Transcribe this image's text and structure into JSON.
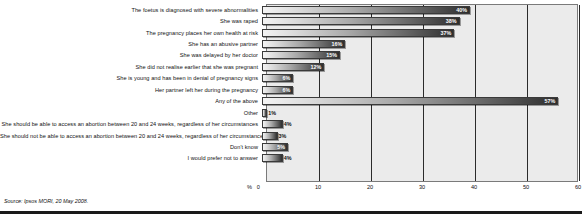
{
  "chart_data": {
    "type": "bar",
    "orientation": "horizontal",
    "title": "",
    "subtitle": "",
    "xlabel": "%",
    "ylabel": "",
    "xlim": [
      0,
      60
    ],
    "grid": true,
    "legend": false,
    "unit_label": "%",
    "axis_zero_label": "0",
    "tick_labels": [
      "10",
      "20",
      "30",
      "40",
      "50",
      "60"
    ],
    "tick_values": [
      10,
      20,
      30,
      40,
      50,
      60
    ],
    "categories": [
      "The foetus is diagnosed with severe abnormalities",
      "She was raped",
      "The pregnancy places her own health at risk",
      "She has an abusive partner",
      "She was delayed by her doctor",
      "She did not realise earlier that she was pregnant",
      "She is young and has been in denial of pregnancy signs",
      "Her partner left her during the pregnancy",
      "Any of the above",
      "Other",
      "She should be able to access an abortion between 20 and 24 weeks, regardless of her circumstances",
      "She should not be able to access an abortion between 20 and 24 weeks, regardless of her circumstances",
      "Don't know",
      "I would prefer not to answer"
    ],
    "values": [
      40,
      38,
      37,
      16,
      15,
      12,
      6,
      6,
      57,
      1,
      4,
      3,
      5,
      4
    ],
    "value_labels": [
      "40%",
      "38%",
      "37%",
      "16%",
      "15%",
      "12%",
      "6%",
      "6%",
      "57%",
      "1%",
      "4%",
      "3%",
      "5%",
      "4%"
    ]
  },
  "footer": {
    "source": "Source: Ipsos MORI, 20 May 2008."
  }
}
